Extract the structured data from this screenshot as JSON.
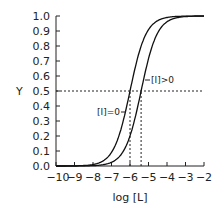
{
  "chart_data": {
    "type": "line",
    "title": "",
    "xlabel": "log [L]",
    "ylabel": "Y",
    "xlim": [
      -10,
      -2
    ],
    "ylim": [
      0.0,
      1.0
    ],
    "x_ticks": [
      -10,
      -9,
      -8,
      -7,
      -6,
      -5,
      -4,
      -3,
      -2
    ],
    "x_tick_labels": [
      "−10",
      "−9",
      "−8",
      "−7",
      "−6",
      "−5",
      "−4",
      "−3",
      "−2"
    ],
    "y_ticks": [
      0.0,
      0.1,
      0.2,
      0.3,
      0.4,
      0.5,
      0.6,
      0.7,
      0.8,
      0.9,
      1.0
    ],
    "y_tick_labels": [
      "0.0",
      "0.1",
      "0.2",
      "0.3",
      "0.4",
      "0.5",
      "0.6",
      "0.7",
      "0.8",
      "0.9",
      "1.0"
    ],
    "grid": false,
    "legend": null,
    "series": [
      {
        "name": "[I]=0",
        "logEC50": -6.0,
        "hill": 1.0,
        "x": [
          -10,
          -9,
          -8,
          -7,
          -6,
          -5,
          -4,
          -3,
          -2
        ],
        "values": [
          0.0001,
          0.001,
          0.0099,
          0.0909,
          0.5,
          0.9091,
          0.9901,
          0.999,
          0.9999
        ]
      },
      {
        "name": "[I]>0",
        "logEC50": -5.4,
        "hill": 1.0,
        "x": [
          -10,
          -9,
          -8,
          -7,
          -6,
          -5,
          -4,
          -3,
          -2
        ],
        "values": [
          0.0,
          0.0003,
          0.0025,
          0.0245,
          0.2007,
          0.7153,
          0.9618,
          0.996,
          0.9996
        ]
      }
    ],
    "annotations": [
      {
        "type": "hline",
        "y": 0.5,
        "style": "dotted"
      },
      {
        "type": "vline",
        "x": -6.0,
        "from_y": 0,
        "to_y": 0.5,
        "style": "dotted"
      },
      {
        "type": "vline",
        "x": -5.4,
        "from_y": 0,
        "to_y": 0.5,
        "style": "dotted"
      },
      {
        "type": "label",
        "text": "[I]=0",
        "points_to": "left curve"
      },
      {
        "type": "label",
        "text": "[I]>0",
        "points_to": "right curve"
      }
    ]
  },
  "labels": {
    "ylabel": "Y",
    "xlabel": "log [L]",
    "curve_a": "[I]=0",
    "curve_b": "[I]>0"
  }
}
